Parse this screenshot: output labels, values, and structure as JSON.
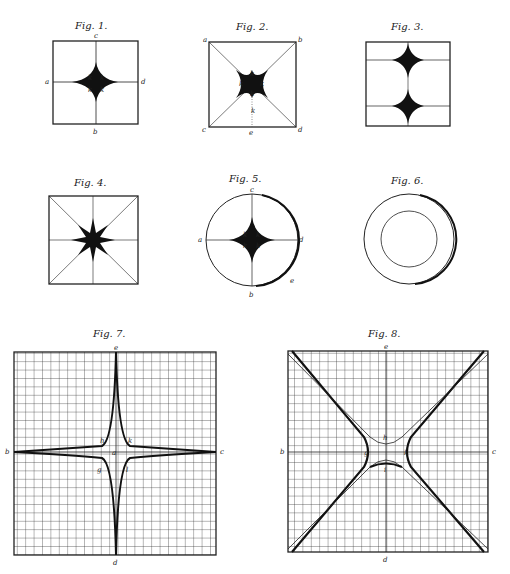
{
  "page": {
    "running_head": "",
    "page_number": ""
  },
  "figures": [
    {
      "id": "fig1",
      "caption": "Fig. 1.",
      "labels": {
        "top": "c",
        "left": "a",
        "right": "d",
        "bottom": "b",
        "center": [
          "k",
          "k",
          "k",
          "k"
        ]
      }
    },
    {
      "id": "fig2",
      "caption": "Fig. 2.",
      "labels": {
        "tl": "a",
        "tr": "b",
        "bl": "c",
        "br": "d",
        "bottom": "e",
        "center": [
          "k",
          "k",
          "k",
          "k"
        ],
        "lower": "k"
      }
    },
    {
      "id": "fig3",
      "caption": "Fig. 3."
    },
    {
      "id": "fig4",
      "caption": "Fig. 4."
    },
    {
      "id": "fig5",
      "caption": "Fig. 5.",
      "labels": {
        "top": "c",
        "left": "a",
        "right": "d",
        "bottom": "b",
        "arc": "e",
        "center": [
          "k",
          "k",
          "k",
          "k"
        ]
      }
    },
    {
      "id": "fig6",
      "caption": "Fig. 6."
    },
    {
      "id": "fig7",
      "caption": "Fig. 7.",
      "labels": {
        "top": "e",
        "left": "b",
        "right": "c",
        "bottom": "d",
        "center": "a",
        "tl": "h",
        "tr": "k",
        "bl": "g",
        "br": "l"
      }
    },
    {
      "id": "fig8",
      "caption": "Fig. 8.",
      "labels": {
        "top": "e",
        "left": "b",
        "right": "c",
        "bottom": "d",
        "upper": "h",
        "lower": "i",
        "leftc": "g",
        "rightc": "k"
      }
    }
  ]
}
